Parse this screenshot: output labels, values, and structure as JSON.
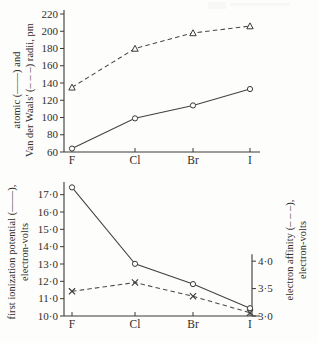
{
  "figure": {
    "background": "#fdfdfb",
    "ink_color": "#3a3a38"
  },
  "categories": [
    "F",
    "Cl",
    "Br",
    "I"
  ],
  "panels": [
    {
      "id": "radii-panel",
      "left_axis_title_line1": "atomic (——) and",
      "left_axis_title_line2": "Van der Waals' (– – –) radii, pm",
      "y_ticks": [
        "60",
        "80",
        "100",
        "120",
        "140",
        "160",
        "180",
        "200",
        "220"
      ]
    },
    {
      "id": "energy-panel",
      "left_axis_title_line1": "first ionization potential (——),",
      "left_axis_title_line2": "electron-volts",
      "right_axis_title_line1": "electron affinity (– – –),",
      "right_axis_title_line2": "electron-volts",
      "y_ticks_left": [
        "10·0",
        "11·0",
        "12·0",
        "13·0",
        "14·0",
        "15·0",
        "16·0",
        "17·0"
      ],
      "y_ticks_right": [
        "3·0",
        "3·5",
        "4·0"
      ]
    }
  ],
  "chart_data": [
    {
      "type": "line",
      "title": "",
      "xlabel": "",
      "ylabel": "atomic (——) and Van der Waals' (– – –) radii, pm",
      "categories": [
        "F",
        "Cl",
        "Br",
        "I"
      ],
      "ylim": [
        60,
        220
      ],
      "ytick_step": 20,
      "grid": false,
      "legend": "inline-in-axis-label",
      "series": [
        {
          "name": "atomic radii",
          "style": "solid",
          "marker": "circle",
          "values": [
            64,
            99,
            114,
            133
          ]
        },
        {
          "name": "Van der Waals' radii",
          "style": "dashed",
          "marker": "triangle",
          "values": [
            135,
            180,
            198,
            206
          ]
        }
      ]
    },
    {
      "type": "line",
      "title": "",
      "xlabel": "",
      "ylabel": "first ionization potential (——), electron-volts",
      "y2label": "electron affinity (– – –), electron-volts",
      "categories": [
        "F",
        "Cl",
        "Br",
        "I"
      ],
      "ylim": [
        10.0,
        17.5
      ],
      "ytick_step": 1.0,
      "y2lim": [
        3.0,
        4.2
      ],
      "y2tick_step": 0.5,
      "grid": false,
      "legend": "inline-in-axis-label",
      "series": [
        {
          "name": "first ionization potential",
          "style": "solid",
          "marker": "circle",
          "axis": "left",
          "values": [
            17.42,
            13.01,
            11.84,
            10.45
          ]
        },
        {
          "name": "electron affinity",
          "style": "dashed",
          "marker": "cross",
          "axis": "right",
          "values": [
            3.45,
            3.61,
            3.36,
            3.06
          ]
        }
      ]
    }
  ]
}
